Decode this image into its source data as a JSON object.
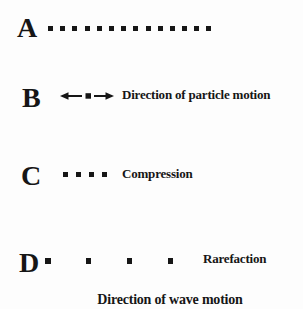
{
  "figure": {
    "rows": [
      {
        "id": "A",
        "label": "A",
        "particle_count": 14,
        "caption": ""
      },
      {
        "id": "B",
        "label": "B",
        "particle_count": 1,
        "caption": "Direction of particle motion"
      },
      {
        "id": "C",
        "label": "C",
        "particle_count": 4,
        "caption": "Compression"
      },
      {
        "id": "D",
        "label": "D",
        "particle_count": 4,
        "caption": "Rarefaction"
      }
    ],
    "footer_caption": "Direction of wave motion"
  },
  "icons": {
    "left_arrow": "left-arrow-icon",
    "right_arrow": "right-arrow-icon"
  },
  "colors": {
    "ink": "#161616",
    "background": "#fdfdfd"
  }
}
